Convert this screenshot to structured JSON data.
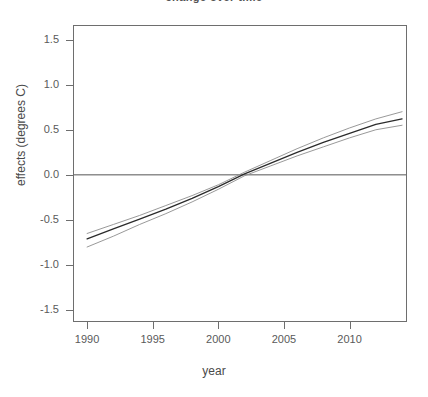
{
  "chart_data": {
    "type": "line",
    "title": "change over time",
    "xlabel": "year",
    "ylabel": "effects (degrees C)",
    "xlim": [
      1989.0,
      2014.3
    ],
    "ylim": [
      -1.62,
      1.65
    ],
    "grid": false,
    "legend": null,
    "xticks": [
      1990,
      1995,
      2000,
      2005,
      2010
    ],
    "xtick_labels": [
      "1990",
      "1995",
      "2000",
      "2005",
      "2010"
    ],
    "yticks": [
      1.5,
      1.0,
      0.5,
      0.0,
      -0.5,
      -1.0,
      -1.5
    ],
    "ytick_labels": [
      "1.5",
      "1.0",
      "0.5",
      "0.0",
      "-0.5",
      "-1.0",
      "-1.5"
    ],
    "reference_line": {
      "y": 0.0,
      "orientation": "horizontal",
      "color": "#555555"
    },
    "x": [
      1990,
      1992,
      1994,
      1996,
      1998,
      2000,
      2002,
      2004,
      2006,
      2008,
      2010,
      2012,
      2014
    ],
    "series": [
      {
        "name": "fit",
        "style": "solid",
        "color": "#2b2b2b",
        "values": [
          -0.71,
          -0.6,
          -0.49,
          -0.38,
          -0.26,
          -0.13,
          0.01,
          0.13,
          0.25,
          0.36,
          0.46,
          0.56,
          0.62
        ]
      },
      {
        "name": "upper confidence band",
        "style": "solid",
        "color": "#8d8d8d",
        "values": [
          -0.65,
          -0.55,
          -0.45,
          -0.34,
          -0.23,
          -0.11,
          0.03,
          0.16,
          0.29,
          0.41,
          0.52,
          0.62,
          0.7
        ]
      },
      {
        "name": "lower confidence band",
        "style": "solid",
        "color": "#8d8d8d",
        "values": [
          -0.8,
          -0.68,
          -0.55,
          -0.43,
          -0.3,
          -0.16,
          -0.01,
          0.1,
          0.21,
          0.31,
          0.41,
          0.5,
          0.55
        ]
      }
    ]
  }
}
